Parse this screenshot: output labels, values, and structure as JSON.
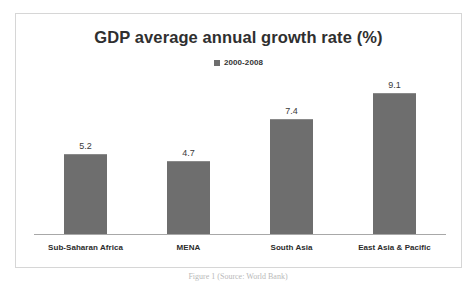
{
  "figure": {
    "caption": "Figure 1 (Source: World Bank)",
    "frame_border_color": "#d6d6d6",
    "background_color": "#ffffff"
  },
  "chart_data": {
    "type": "bar",
    "title": "GDP average annual growth rate (%)",
    "subtitle": "",
    "xlabel": "",
    "ylabel": "",
    "categories": [
      "Sub-Saharan Africa",
      "MENA",
      "South Asia",
      "East Asia & Pacific"
    ],
    "values": [
      5.2,
      4.7,
      7.4,
      9.1
    ],
    "value_labels": [
      "5.2",
      "4.7",
      "7.4",
      "9.1"
    ],
    "series": [
      {
        "name": "2000-2008",
        "values": [
          5.2,
          4.7,
          7.4,
          9.1
        ],
        "color": "#6e6e6e"
      }
    ],
    "ylim": [
      0,
      10.2
    ],
    "grid": false,
    "y_axis_visible": false,
    "x_axis_visible": true,
    "legend": {
      "position": "top-center",
      "entries": [
        {
          "label": "2000-2008",
          "marker": "square-marker",
          "color": "#6e6e6e"
        }
      ]
    },
    "bar_color": "#6e6e6e",
    "axis_color": "#a8a8a8",
    "title_color": "#2f2f2f",
    "label_color": "#2b2b2b"
  }
}
